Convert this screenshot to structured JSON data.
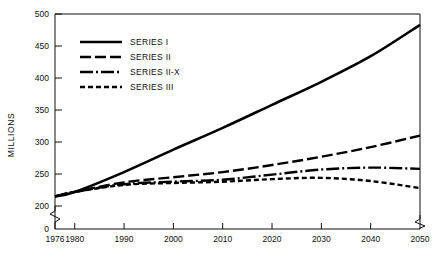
{
  "chart_data": {
    "type": "line",
    "title": "",
    "xlabel": "",
    "ylabel": "MILLIONS",
    "xlim": [
      1976,
      2050
    ],
    "ylim": [
      200,
      500
    ],
    "y_axis_break": true,
    "y_break_from": 0,
    "y_break_to": 200,
    "grid": false,
    "legend_position": "upper-left",
    "xticks": [
      1976,
      1980,
      1990,
      2000,
      2010,
      2020,
      2030,
      2040,
      2050
    ],
    "xtick_labels": [
      "1976",
      "1980",
      "1990",
      "2000",
      "2010",
      "2020",
      "2030",
      "2040",
      "2050"
    ],
    "yticks": [
      0,
      200,
      250,
      300,
      350,
      400,
      450,
      500
    ],
    "ytick_labels": [
      "0",
      "200",
      "250",
      "300",
      "350",
      "400",
      "450",
      "500"
    ],
    "x": [
      1976,
      1980,
      1990,
      2000,
      2010,
      2020,
      2030,
      2040,
      2050
    ],
    "series": [
      {
        "name": "SERIES I",
        "style": "solid",
        "values": [
          215,
          222,
          253,
          288,
          322,
          358,
          394,
          434,
          483
        ]
      },
      {
        "name": "SERIES II",
        "style": "dashed",
        "values": [
          215,
          222,
          237,
          245,
          253,
          264,
          277,
          292,
          310
        ]
      },
      {
        "name": "SERIES II-X",
        "style": "dash-dot",
        "values": [
          215,
          222,
          234,
          238,
          241,
          249,
          257,
          260,
          258
        ]
      },
      {
        "name": "SERIES III",
        "style": "dotted",
        "values": [
          215,
          222,
          233,
          236,
          238,
          242,
          244,
          239,
          228
        ]
      }
    ]
  },
  "legend": {
    "entries": [
      {
        "label": "SERIES I"
      },
      {
        "label": "SERIES II"
      },
      {
        "label": "SERIES II-X"
      },
      {
        "label": "SERIES III"
      }
    ]
  },
  "colors": {
    "ink": "#111111",
    "series": "#000000",
    "background": "#ffffff"
  }
}
